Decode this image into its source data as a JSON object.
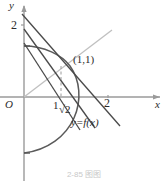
{
  "figure": {
    "axis": {
      "y_label": "y",
      "x_label": "x",
      "origin_label": "O",
      "y_ticks": [
        "2"
      ],
      "x_ticks": [
        "1",
        "2"
      ],
      "x_tick_sqrt": "2"
    },
    "annotations": {
      "point_label": "(1,1)",
      "curve_label": "y=f(x)"
    },
    "caption": "2-85  图图",
    "colors": {
      "curve": "#555555",
      "secant": "#4a4a4a",
      "axis": "#9a9a9a",
      "diagonal": "#b8b8b8",
      "dashed": "#9a9a9a",
      "text": "#2b2b2b"
    }
  }
}
